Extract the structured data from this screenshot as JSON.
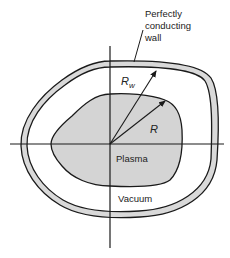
{
  "diagram": {
    "title_label": [
      "Perfectly",
      "conducting",
      "wall"
    ],
    "wall_radius_label": "R",
    "wall_radius_subscript": "w",
    "plasma_radius_label": "R",
    "plasma_label": "Plasma",
    "vacuum_label": "Vacuum"
  },
  "colors": {
    "line": "#1a1a1a",
    "wall_fill": "#d9d9d9",
    "plasma_fill": "#d4d4d4",
    "background": "#ffffff"
  }
}
